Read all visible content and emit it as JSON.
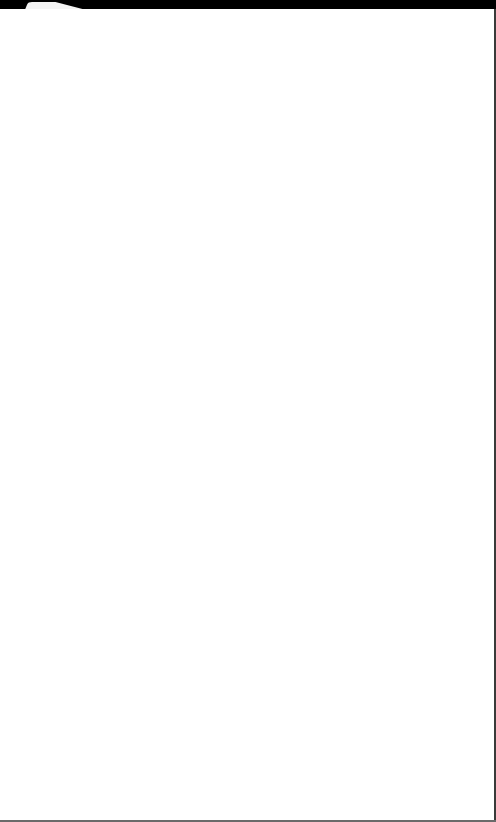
{
  "window": {
    "topbar_color": "#000000",
    "page_background": "#ffffff"
  },
  "tabs": [
    {
      "label": ""
    }
  ],
  "main": {
    "content": ""
  }
}
